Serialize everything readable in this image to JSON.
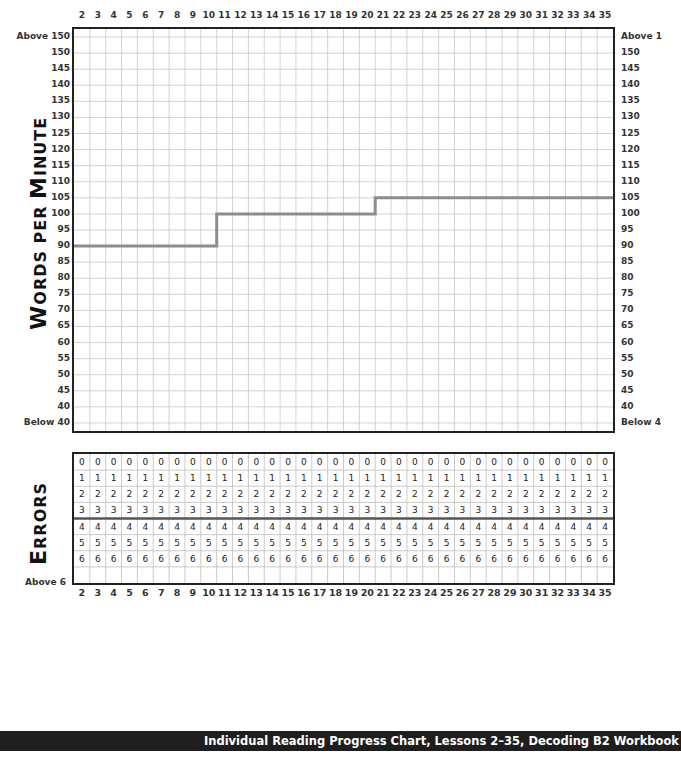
{
  "chart_data": [
    {
      "type": "line",
      "title": "Words per Minute",
      "xlabel": "Lesson",
      "ylabel": "Words per Minute",
      "x": [
        2,
        3,
        4,
        5,
        6,
        7,
        8,
        9,
        10,
        11,
        12,
        13,
        14,
        15,
        16,
        17,
        18,
        19,
        20,
        21,
        22,
        23,
        24,
        25,
        26,
        27,
        28,
        29,
        30,
        31,
        32,
        33,
        34,
        35
      ],
      "series": [
        {
          "name": "Target goal (step line)",
          "color": "#8c8c8c",
          "values": [
            90,
            90,
            90,
            90,
            90,
            90,
            90,
            90,
            90,
            100,
            100,
            100,
            100,
            100,
            100,
            100,
            100,
            100,
            100,
            105,
            105,
            105,
            105,
            105,
            105,
            105,
            105,
            105,
            105,
            105,
            105,
            105,
            105,
            105
          ]
        }
      ],
      "y_tick_labels_left": [
        "Above 150",
        "150",
        "145",
        "140",
        "135",
        "130",
        "125",
        "120",
        "115",
        "110",
        "105",
        "100",
        "95",
        "90",
        "85",
        "80",
        "75",
        "70",
        "65",
        "60",
        "55",
        "50",
        "45",
        "40",
        "Below 40"
      ],
      "y_tick_labels_right": [
        "Above 1",
        "150",
        "145",
        "140",
        "135",
        "130",
        "125",
        "120",
        "115",
        "110",
        "105",
        "100",
        "95",
        "90",
        "85",
        "80",
        "75",
        "70",
        "65",
        "60",
        "55",
        "50",
        "45",
        "40",
        "Below 4"
      ],
      "ylim": [
        35,
        155
      ],
      "grid": true
    },
    {
      "type": "table",
      "title": "Errors",
      "columns": [
        2,
        3,
        4,
        5,
        6,
        7,
        8,
        9,
        10,
        11,
        12,
        13,
        14,
        15,
        16,
        17,
        18,
        19,
        20,
        21,
        22,
        23,
        24,
        25,
        26,
        27,
        28,
        29,
        30,
        31,
        32,
        33,
        34,
        35
      ],
      "rows": [
        "0",
        "1",
        "2",
        "3",
        "4",
        "5",
        "6",
        ""
      ],
      "bottom_label": "Above 6"
    }
  ],
  "lessons": [
    "2",
    "3",
    "4",
    "5",
    "6",
    "7",
    "8",
    "9",
    "10",
    "11",
    "12",
    "13",
    "14",
    "15",
    "16",
    "17",
    "18",
    "19",
    "20",
    "21",
    "22",
    "23",
    "24",
    "25",
    "26",
    "27",
    "28",
    "29",
    "30",
    "31",
    "32",
    "33",
    "34",
    "35"
  ],
  "wpm": {
    "axis_title_first_big": "W",
    "axis_title_rest_1": "ORDS PER ",
    "axis_title_big_2": "M",
    "axis_title_rest_2": "INUTE",
    "left_labels": [
      "Above 150",
      "150",
      "145",
      "140",
      "135",
      "130",
      "125",
      "120",
      "115",
      "110",
      "105",
      "100",
      "95",
      "90",
      "85",
      "80",
      "75",
      "70",
      "65",
      "60",
      "55",
      "50",
      "45",
      "40",
      "Below 40"
    ],
    "right_labels": [
      "Above 1",
      "150",
      "145",
      "140",
      "135",
      "130",
      "125",
      "120",
      "115",
      "110",
      "105",
      "100",
      "95",
      "90",
      "85",
      "80",
      "75",
      "70",
      "65",
      "60",
      "55",
      "50",
      "45",
      "40",
      "Below 4"
    ],
    "line_color": "#8c8c8c"
  },
  "errors": {
    "axis_title_big": "E",
    "axis_title_rest": "RRORS",
    "row_values": [
      "0",
      "1",
      "2",
      "3",
      "4",
      "5",
      "6"
    ],
    "bottom_label": "Above 6"
  },
  "footer": {
    "text": "Individual Reading Progress Chart, Lessons 2–35, Decoding B2 Workbook"
  }
}
